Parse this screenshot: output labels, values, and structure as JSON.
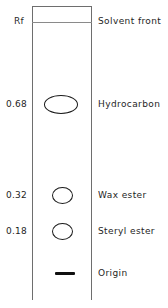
{
  "figure": {
    "type": "tlc-plate-diagram",
    "axis_header": "Rf",
    "solvent_front_label": "Solvent front",
    "origin_label": "Origin",
    "plate": {
      "left": 32,
      "right": 92,
      "top": 6,
      "bottom": 300,
      "solvent_front_y": 22,
      "origin_y": 274,
      "border_color": "#6e6e6e",
      "spot_color": "#1a1a1a",
      "origin_color": "#101010"
    },
    "bands": [
      {
        "rf": "0.68",
        "label": "Hydrocarbon",
        "cx": 60.5,
        "cy": 104,
        "rx": 17,
        "ry": 9.5
      },
      {
        "rf": "0.32",
        "label": "Wax ester",
        "cx": 62,
        "cy": 195,
        "rx": 10.5,
        "ry": 8.5
      },
      {
        "rf": "0.18",
        "label": "Steryl ester",
        "cx": 62,
        "cy": 231,
        "rx": 10.5,
        "ry": 8.5
      }
    ],
    "origin": {
      "x": 55,
      "y": 272,
      "width": 20,
      "height": 3
    }
  }
}
